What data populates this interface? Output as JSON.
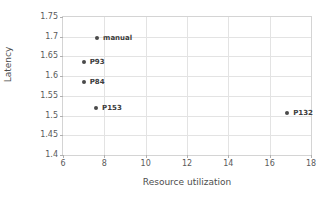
{
  "chart_data": {
    "type": "scatter",
    "title": "",
    "xlabel": "Resource utilization",
    "ylabel": "Latency",
    "xlim": [
      6,
      18
    ],
    "ylim": [
      1.4,
      1.75
    ],
    "xticks": [
      "6",
      "8",
      "10",
      "12",
      "14",
      "16",
      "18"
    ],
    "xtick_values": [
      6,
      8,
      10,
      12,
      14,
      16,
      18
    ],
    "yticks": [
      "1.4",
      "1.45",
      "1.5",
      "1.55",
      "1.6",
      "1.65",
      "1.7",
      "1.75"
    ],
    "ytick_values": [
      1.4,
      1.45,
      1.5,
      1.55,
      1.6,
      1.65,
      1.7,
      1.75
    ],
    "grid": true,
    "legend": "none",
    "marker_color": "#4a4a4a",
    "grid_color": "#e3e3e3",
    "points": [
      {
        "label": "manual",
        "x": 7.65,
        "y": 1.698
      },
      {
        "label": "P93",
        "x": 7.0,
        "y": 1.637
      },
      {
        "label": "P84",
        "x": 7.0,
        "y": 1.584
      },
      {
        "label": "P153",
        "x": 7.6,
        "y": 1.52
      },
      {
        "label": "P132",
        "x": 16.85,
        "y": 1.506
      }
    ]
  }
}
